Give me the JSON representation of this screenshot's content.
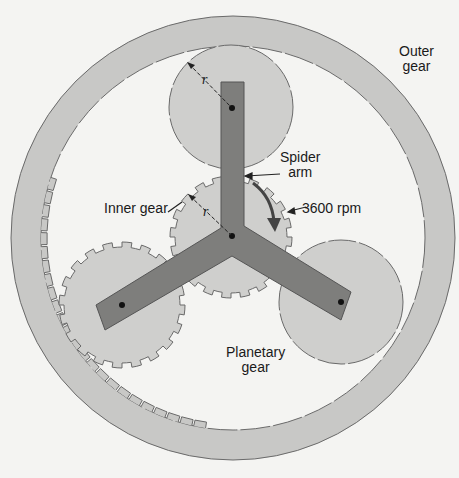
{
  "figure": {
    "labels": {
      "outer_gear_line1": "Outer",
      "outer_gear_line2": "gear",
      "spider_arm_line1": "Spider",
      "spider_arm_line2": "arm",
      "inner_gear": "Inner gear",
      "speed": "3600 rpm",
      "planetary_gear_line1": "Planetary",
      "planetary_gear_line2": "gear",
      "radius_symbol_top": "r",
      "radius_symbol_inner": "r"
    },
    "colors": {
      "background": "#f4f4f2",
      "ring_fill": "#c8c8c6",
      "gear_fill": "#cfcfcd",
      "arm_fill": "#7e7e7c",
      "outline": "#6a6a6a",
      "pin": "#111111"
    },
    "components": [
      "outer-ring-gear",
      "inner-sun-gear",
      "planetary-gear-top",
      "planetary-gear-left",
      "planetary-gear-right",
      "spider-arm"
    ]
  }
}
